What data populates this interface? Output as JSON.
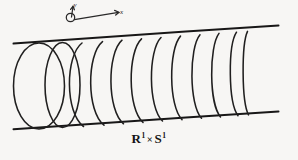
{
  "figure": {
    "caption": {
      "base_left": "R",
      "exponent_left": "1",
      "operator": "×",
      "base_right": "S",
      "exponent_right": "1",
      "full_text": "R¹ × S¹"
    },
    "axes": {
      "x_label": "x",
      "y_label": "y",
      "origin_marker": "small-circle"
    },
    "colors": {
      "background": "#f7f6f4",
      "ink": "#1d1c1c",
      "rail": "#181717",
      "caption": "#141313"
    },
    "geometry": {
      "width": 298,
      "height": 160,
      "coil_count": 10,
      "rail_top_left_y": 43,
      "rail_top_right_y": 26,
      "rail_bottom_left_y": 129,
      "rail_bottom_right_y": 112,
      "rail_left_x": 13,
      "rail_right_x": 279
    }
  }
}
